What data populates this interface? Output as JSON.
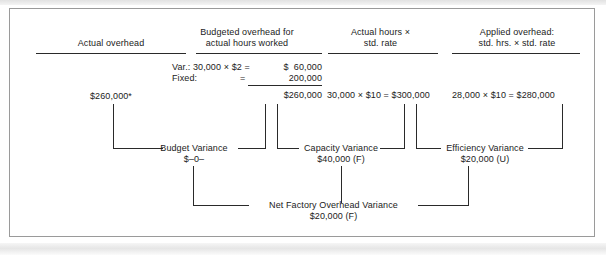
{
  "figure": {
    "columns": [
      {
        "id": "actual-overhead",
        "heading_line1": "Actual overhead",
        "heading_line2": ""
      },
      {
        "id": "budgeted-overhead",
        "heading_line1": "Budgeted overhead for",
        "heading_line2": "actual hours worked"
      },
      {
        "id": "actual-hours-std-rate",
        "heading_line1": "Actual hours ×",
        "heading_line2": "std. rate"
      },
      {
        "id": "applied-overhead",
        "heading_line1": "Applied overhead:",
        "heading_line2": "std. hrs. × std. rate"
      }
    ],
    "values": {
      "actual_overhead": "$260,000*",
      "budgeted_variable_label": "Var.: 30,000 × $2 =",
      "budgeted_variable_amount": "$  60,000",
      "budgeted_fixed_label": "Fixed:",
      "budgeted_fixed_eq": "=",
      "budgeted_fixed_amount": "200,000",
      "budgeted_total": "$260,000",
      "actual_hours_calc": "30,000 × $10 = $300,000",
      "applied_overhead_calc": "28,000 × $10 = $280,000"
    },
    "variances": [
      {
        "id": "budget-variance",
        "name": "Budget Variance",
        "amount": "$–0–"
      },
      {
        "id": "capacity-variance",
        "name": "Capacity Variance",
        "amount": "$40,000 (F)"
      },
      {
        "id": "efficiency-variance",
        "name": "Efficiency Variance",
        "amount": "$20,000 (U)"
      }
    ],
    "net": {
      "id": "net-factory-overhead-variance",
      "name": "Net Factory Overhead Variance",
      "amount": "$20,000 (F)"
    },
    "colors": {
      "line": "#2a2a2a",
      "text": "#1b1b1b",
      "frame": "#9a9a9a",
      "background": "#ffffff"
    }
  }
}
